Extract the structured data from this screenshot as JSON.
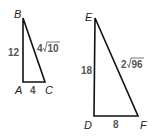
{
  "diagram": {
    "triangles": [
      {
        "name": "ABC",
        "vertices": {
          "A": "A",
          "B": "B",
          "C": "C"
        },
        "sides": {
          "AB": "12",
          "AC": "4",
          "BC_coef": "4",
          "BC_rad": "10"
        }
      },
      {
        "name": "DEF",
        "vertices": {
          "D": "D",
          "E": "E",
          "F": "F"
        },
        "sides": {
          "DE": "18",
          "DF": "8",
          "EF_coef": "2",
          "EF_rad": "96"
        }
      }
    ]
  }
}
